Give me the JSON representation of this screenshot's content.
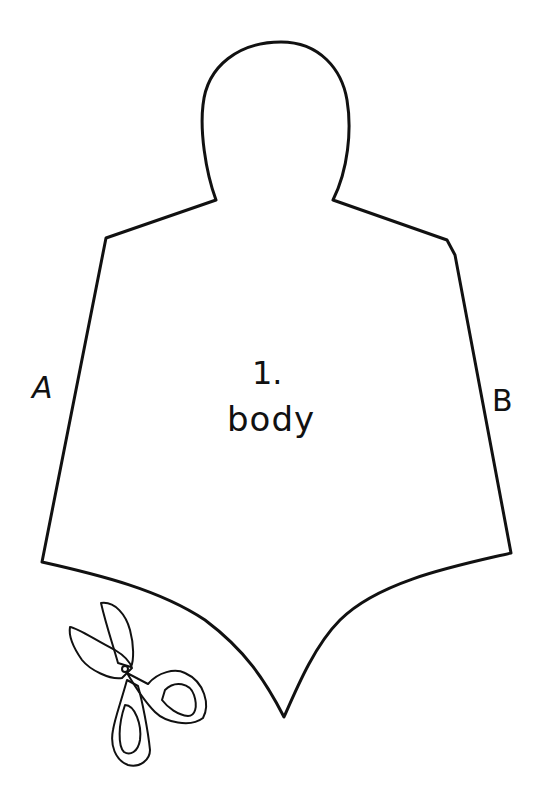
{
  "pattern": {
    "piece_number": "1.",
    "piece_name": "body",
    "edge_labels": {
      "left": "A",
      "right": "B"
    },
    "outline_color": "#111111",
    "background_color": "#ffffff"
  },
  "icons": {
    "cut_indicator": "scissors-icon"
  }
}
